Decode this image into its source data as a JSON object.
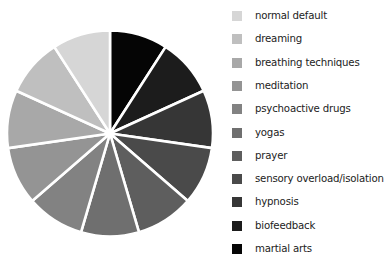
{
  "chart_data": {
    "type": "pie",
    "title": "",
    "start_angle_deg": 0,
    "direction": "clockwise-from-12-oclock-listed-in-reverse-legend-order",
    "legend_position": "right",
    "categories": [
      "normal default",
      "dreaming",
      "breathing techniques",
      "meditation",
      "psychoactive drugs",
      "yogas",
      "prayer",
      "sensory overload/isolation",
      "hypnosis",
      "biofeedback",
      "martial arts"
    ],
    "values": [
      1,
      1,
      1,
      1,
      1,
      1,
      1,
      1,
      1,
      1,
      1
    ],
    "colors": [
      "#d6d6d6",
      "#bfbfbf",
      "#a8a8a8",
      "#949494",
      "#828282",
      "#6f6f6f",
      "#5e5e5e",
      "#4a4a4a",
      "#363636",
      "#1c1c1c",
      "#050505"
    ],
    "separator_color": "#ffffff"
  }
}
